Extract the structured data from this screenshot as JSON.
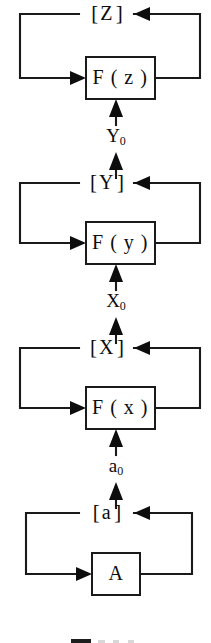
{
  "figure": {
    "background_color": "#ffffff",
    "line_color": "#1a1a1a",
    "text_color": "#0d0d0d"
  },
  "stages": [
    {
      "id": "stage-z",
      "state_label": "[ Z ]",
      "state_open_bracket": "[",
      "state_symbol": "Z",
      "state_close_bracket": "]",
      "process_label": "F ( z )",
      "process_fn": "F",
      "process_arg": "z",
      "input_signal": "Y",
      "input_signal_sub": "0"
    },
    {
      "id": "stage-y",
      "state_label": "[ Y ]",
      "state_open_bracket": "[",
      "state_symbol": "Y",
      "state_close_bracket": "]",
      "process_label": "F ( y )",
      "process_fn": "F",
      "process_arg": "y",
      "input_signal": "X",
      "input_signal_sub": "0"
    },
    {
      "id": "stage-x",
      "state_label": "[ X ]",
      "state_open_bracket": "[",
      "state_symbol": "X",
      "state_close_bracket": "]",
      "process_label": "F ( x )",
      "process_fn": "F",
      "process_arg": "x",
      "input_signal": "a",
      "input_signal_sub": "0"
    },
    {
      "id": "stage-a",
      "state_label": "[ a ]",
      "state_open_bracket": "[",
      "state_symbol": "a",
      "state_close_bracket": "]",
      "process_label": "A",
      "process_fn": "A",
      "process_arg": "",
      "input_signal": "",
      "input_signal_sub": ""
    }
  ],
  "signals": [
    {
      "id": "signal-y0",
      "base": "Y",
      "sub": "0"
    },
    {
      "id": "signal-x0",
      "base": "X",
      "sub": "0"
    },
    {
      "id": "signal-a0",
      "base": "a",
      "sub": "0"
    }
  ],
  "caption": {
    "text": "",
    "note": "figure caption cropped at bottom edge"
  }
}
